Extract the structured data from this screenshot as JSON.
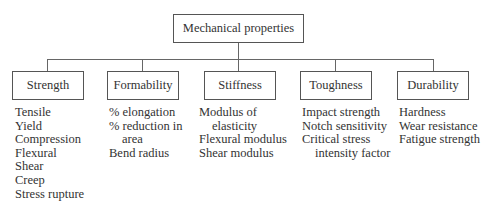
{
  "root": {
    "label": "Mechanical properties"
  },
  "categories": [
    {
      "label": "Strength",
      "items": [
        {
          "text": "Tensile",
          "indent": false
        },
        {
          "text": "Yield",
          "indent": false
        },
        {
          "text": "Compression",
          "indent": false
        },
        {
          "text": "Flexural",
          "indent": false
        },
        {
          "text": "Shear",
          "indent": false
        },
        {
          "text": "Creep",
          "indent": false
        },
        {
          "text": "Stress rupture",
          "indent": false
        }
      ]
    },
    {
      "label": "Formability",
      "items": [
        {
          "text": "% elongation",
          "indent": false
        },
        {
          "text": "% reduction in",
          "indent": false
        },
        {
          "text": "area",
          "indent": true
        },
        {
          "text": "Bend radius",
          "indent": false
        }
      ]
    },
    {
      "label": "Stiffness",
      "items": [
        {
          "text": "Modulus of",
          "indent": false
        },
        {
          "text": "elasticity",
          "indent": true
        },
        {
          "text": "Flexural modulus",
          "indent": false
        },
        {
          "text": "Shear modulus",
          "indent": false
        }
      ]
    },
    {
      "label": "Toughness",
      "items": [
        {
          "text": "Impact strength",
          "indent": false
        },
        {
          "text": "Notch sensitivity",
          "indent": false
        },
        {
          "text": "Critical stress",
          "indent": false
        },
        {
          "text": "intensity factor",
          "indent": true
        }
      ]
    },
    {
      "label": "Durability",
      "items": [
        {
          "text": "Hardness",
          "indent": false
        },
        {
          "text": "Wear resistance",
          "indent": false
        },
        {
          "text": "Fatigue strength",
          "indent": false
        }
      ]
    }
  ]
}
